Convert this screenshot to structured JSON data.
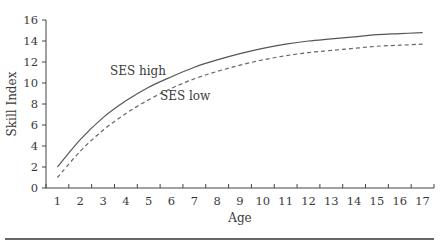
{
  "chart_data": {
    "type": "line",
    "title": "",
    "xlabel": "Age",
    "ylabel": "Skill Index",
    "x": [
      1,
      2,
      3,
      4,
      5,
      6,
      7,
      8,
      9,
      10,
      11,
      12,
      13,
      14,
      15,
      16,
      17
    ],
    "xlim": [
      0.5,
      17.5
    ],
    "ylim": [
      0,
      16
    ],
    "yticks": [
      0,
      2,
      4,
      6,
      8,
      10,
      12,
      14,
      16
    ],
    "grid": false,
    "legend": "inline labels",
    "series": [
      {
        "name": "SES high",
        "style": "solid",
        "color": "#555555",
        "values": [
          2.0,
          4.6,
          6.7,
          8.3,
          9.6,
          10.6,
          11.5,
          12.2,
          12.8,
          13.3,
          13.7,
          14.0,
          14.2,
          14.4,
          14.6,
          14.7,
          14.8
        ]
      },
      {
        "name": "SES low",
        "style": "dashed",
        "color": "#666666",
        "values": [
          1.0,
          3.5,
          5.5,
          7.1,
          8.4,
          9.5,
          10.4,
          11.1,
          11.7,
          12.2,
          12.6,
          12.9,
          13.1,
          13.3,
          13.5,
          13.6,
          13.7
        ]
      }
    ],
    "annotations": [
      {
        "text": "SES high",
        "series": 0
      },
      {
        "text": "SES low",
        "series": 1
      }
    ]
  }
}
